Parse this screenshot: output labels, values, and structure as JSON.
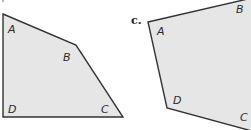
{
  "figures": [
    {
      "id": "left",
      "vertices": [
        {
          "label": "A",
          "x": 3,
          "y": 14
        },
        {
          "label": "B",
          "x": 76,
          "y": 45
        },
        {
          "label": "C",
          "x": 123,
          "y": 117
        },
        {
          "label": "D",
          "x": 3,
          "y": 117
        }
      ]
    },
    {
      "id": "right",
      "part_label": "c.",
      "vertices": [
        {
          "label": "A",
          "x": 148,
          "y": 22
        },
        {
          "label": "B",
          "x": 251,
          "y": -2
        },
        {
          "label": "C",
          "x": 251,
          "y": 130
        },
        {
          "label": "D",
          "x": 167,
          "y": 108
        }
      ]
    }
  ],
  "labels": {
    "left": {
      "A": "A",
      "B": "B",
      "C": "C",
      "D": "D"
    },
    "right": {
      "part": "c.",
      "A": "A",
      "B": "B",
      "C": "C",
      "D": "D"
    }
  },
  "colors": {
    "fill": "#e6e6e6",
    "stroke": "#333333"
  }
}
